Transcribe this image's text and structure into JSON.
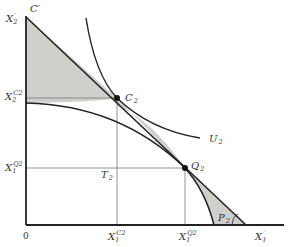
{
  "diagram": {
    "type": "economics-trade-diagram",
    "colors": {
      "shade": "#cfcfcb",
      "line": "#222222",
      "guide": "#777777",
      "text": "#333333"
    },
    "axes": {
      "origin_label": "0",
      "y_axis_top_label": "X",
      "y_axis_top_sub": "2",
      "y_axis_top_sup": "′",
      "x_axis_right_label": "X",
      "x_axis_right_sub": "1",
      "x_axis_right_sup": "′"
    },
    "consumption_line_label": "C′",
    "points": {
      "c2": {
        "label": "C",
        "sub": "2"
      },
      "q2": {
        "label": "Q",
        "sub": "2"
      },
      "t2": {
        "label": "T",
        "sub": "2"
      },
      "p2": {
        "label": "P",
        "sub": "2"
      }
    },
    "curves": {
      "indifference": {
        "label": "U",
        "sub": "2"
      }
    },
    "ticks": {
      "y": [
        {
          "label": "X",
          "sub": "2",
          "sup": "C2"
        },
        {
          "label": "X",
          "sub": "1",
          "sup": "Q2"
        }
      ],
      "x": [
        {
          "label": "X",
          "sub": "1",
          "sup": "C2"
        },
        {
          "label": "X",
          "sub": "1",
          "sup": "Q2"
        }
      ]
    }
  }
}
